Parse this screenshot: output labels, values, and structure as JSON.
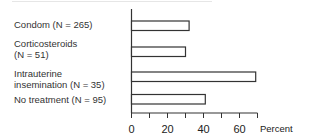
{
  "chart_data": {
    "type": "bar",
    "orientation": "horizontal",
    "title": "",
    "xlabel": "Percent",
    "ylabel": "",
    "categories": [
      "Condom (N = 265)",
      "Corticosteroids (N = 51)",
      "Intrauterine insemination (N = 35)",
      "No treatment (N = 95)"
    ],
    "category_lines": [
      [
        "Condom (N = 265)"
      ],
      [
        "Corticosteroids",
        "(N = 51)"
      ],
      [
        "Intrauterine",
        "insemination (N = 35)"
      ],
      [
        "No treatment (N = 95)"
      ]
    ],
    "values": [
      32,
      30,
      69,
      41
    ],
    "xlim": [
      0,
      70
    ],
    "xticks": [
      0,
      10,
      20,
      30,
      40,
      50,
      60,
      70
    ],
    "xtick_labels": [
      "0",
      "20",
      "40",
      "60"
    ],
    "xtick_label_values": [
      0,
      20,
      40,
      60
    ],
    "grid": false,
    "legend": null,
    "bar_fill": "#ffffff",
    "bar_stroke": "#333333"
  }
}
